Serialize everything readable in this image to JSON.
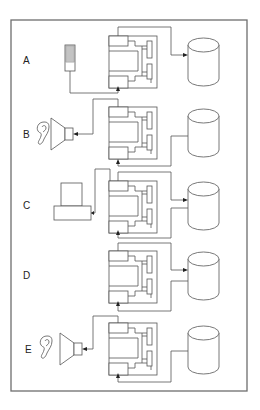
{
  "diagram": {
    "rows": [
      {
        "label": "A",
        "input": "keypad-device",
        "db_link": "top-arrow-to-db"
      },
      {
        "label": "B",
        "input": "speaker-with-ear",
        "db_link": "bottom-from-db"
      },
      {
        "label": "C",
        "input": "printer-terminal",
        "db_link": "top-arrow-and-bottom"
      },
      {
        "label": "D",
        "input": "none",
        "db_link": "top-arrow-and-bottom"
      },
      {
        "label": "E",
        "input": "speaker-with-ear",
        "db_link": "bottom-from-db"
      }
    ],
    "colors": {
      "line": "#555555",
      "frame": "#6e6e6e",
      "background": "#ffffff"
    }
  }
}
